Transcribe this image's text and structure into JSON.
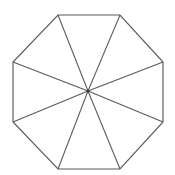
{
  "figure": {
    "shape_name": "octagon",
    "side_count": 8,
    "triangle_count": 8,
    "spoke_count": 8,
    "canvas": {
      "width": 175,
      "height": 175
    },
    "colors": {
      "background": "#ffffff",
      "stroke": "#595959",
      "fill": "#ffffff",
      "center_dot": "#3d3d3d"
    },
    "stroke_width": 1.15,
    "center_point": {
      "x": 88,
      "y": 91,
      "label": "center"
    },
    "vertices": [
      {
        "id": "v1",
        "label": "top-left",
        "x": 58,
        "y": 15
      },
      {
        "id": "v2",
        "label": "top-right",
        "x": 120,
        "y": 15
      },
      {
        "id": "v3",
        "label": "right-upper",
        "x": 163,
        "y": 62
      },
      {
        "id": "v4",
        "label": "right-lower",
        "x": 163,
        "y": 122
      },
      {
        "id": "v5",
        "label": "bottom-right",
        "x": 120,
        "y": 169
      },
      {
        "id": "v6",
        "label": "bottom-left",
        "x": 58,
        "y": 169
      },
      {
        "id": "v7",
        "label": "left-lower",
        "x": 13,
        "y": 122
      },
      {
        "id": "v8",
        "label": "left-upper",
        "x": 13,
        "y": 62
      }
    ],
    "edges": [
      {
        "id": "e1",
        "label": "top-edge",
        "from": "v1",
        "to": "v2"
      },
      {
        "id": "e2",
        "label": "upper-right-edge",
        "from": "v2",
        "to": "v3"
      },
      {
        "id": "e3",
        "label": "right-edge",
        "from": "v3",
        "to": "v4"
      },
      {
        "id": "e4",
        "label": "lower-right-edge",
        "from": "v4",
        "to": "v5"
      },
      {
        "id": "e5",
        "label": "bottom-edge",
        "from": "v5",
        "to": "v6"
      },
      {
        "id": "e6",
        "label": "lower-left-edge",
        "from": "v6",
        "to": "v7"
      },
      {
        "id": "e7",
        "label": "left-edge",
        "from": "v7",
        "to": "v8"
      },
      {
        "id": "e8",
        "label": "upper-left-edge",
        "from": "v8",
        "to": "v1"
      }
    ],
    "spokes": [
      {
        "id": "s1",
        "label": "spoke-to-top-left",
        "to": "v1"
      },
      {
        "id": "s2",
        "label": "spoke-to-top-right",
        "to": "v2"
      },
      {
        "id": "s3",
        "label": "spoke-to-right-upper",
        "to": "v3"
      },
      {
        "id": "s4",
        "label": "spoke-to-right-lower",
        "to": "v4"
      },
      {
        "id": "s5",
        "label": "spoke-to-bottom-right",
        "to": "v5"
      },
      {
        "id": "s6",
        "label": "spoke-to-bottom-left",
        "to": "v6"
      },
      {
        "id": "s7",
        "label": "spoke-to-left-lower",
        "to": "v7"
      },
      {
        "id": "s8",
        "label": "spoke-to-left-upper",
        "to": "v8"
      }
    ]
  }
}
